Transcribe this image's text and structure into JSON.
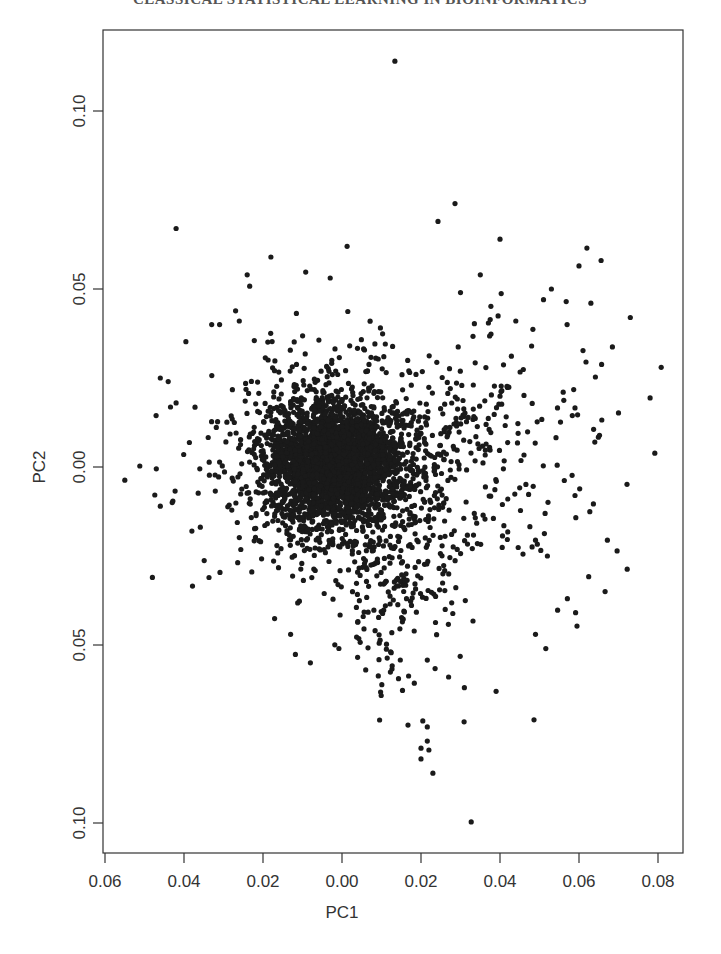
{
  "page": {
    "running_header": "CLASSICAL STATISTICAL LEARNING IN BIOINFORMATICS"
  },
  "chart_data": {
    "type": "scatter",
    "title": "",
    "xlabel": "PC1",
    "ylabel": "PC2",
    "xlim": [
      -0.061,
      0.087
    ],
    "ylim": [
      -0.108,
      0.123
    ],
    "x_ticks": [
      -0.06,
      -0.04,
      -0.02,
      0.0,
      0.02,
      0.04,
      0.06,
      0.08
    ],
    "x_tick_labels": [
      "0.06",
      "0.04",
      "0.02",
      "0.00",
      "0.02",
      "0.04",
      "0.06",
      "0.08"
    ],
    "y_ticks": [
      0.1,
      0.05,
      0.0,
      -0.05,
      -0.1
    ],
    "y_tick_labels": [
      "0.10",
      "0.05",
      "0.00",
      "0.05",
      "0.10"
    ],
    "grid": false,
    "legend": null,
    "point_color": "#1a1a1a",
    "point_radius": 2.6,
    "dense_cluster": {
      "center": [
        -0.002,
        0.001
      ],
      "sd": [
        0.0085,
        0.0085
      ],
      "n": 2600,
      "seed": 7
    },
    "halo": {
      "center": [
        0.002,
        0.0
      ],
      "sd": [
        0.017,
        0.016
      ],
      "n": 900,
      "seed": 13
    },
    "tail_down": {
      "center": [
        0.012,
        -0.035
      ],
      "sd": [
        0.008,
        0.014
      ],
      "n": 160,
      "seed": 29
    },
    "tail_right": {
      "center": [
        0.04,
        0.005
      ],
      "sd": [
        0.015,
        0.018
      ],
      "n": 170,
      "seed": 41
    },
    "outliers": [
      [
        0.0134,
        0.114
      ],
      [
        -0.042,
        0.067
      ],
      [
        0.0286,
        0.074
      ],
      [
        0.0243,
        0.069
      ],
      [
        0.04,
        0.064
      ],
      [
        0.0013,
        0.062
      ],
      [
        0.062,
        0.0615
      ],
      [
        0.0656,
        0.058
      ],
      [
        0.06,
        0.0565
      ],
      [
        -0.018,
        0.059
      ],
      [
        -0.024,
        0.054
      ],
      [
        0.0808,
        0.028
      ],
      [
        0.078,
        0.0194
      ],
      [
        0.07,
        0.0152
      ],
      [
        0.073,
        0.042
      ],
      [
        -0.055,
        -0.0037
      ],
      [
        -0.048,
        -0.031
      ],
      [
        0.0327,
        -0.0997
      ],
      [
        0.023,
        -0.086
      ],
      [
        0.02,
        -0.082
      ],
      [
        0.02,
        -0.079
      ],
      [
        0.022,
        -0.0795
      ],
      [
        0.0216,
        -0.077
      ],
      [
        0.0167,
        -0.0725
      ],
      [
        0.0216,
        -0.073
      ],
      [
        0.0486,
        -0.071
      ],
      [
        0.0722,
        -0.0287
      ],
      [
        0.0666,
        -0.035
      ],
      [
        0.0595,
        -0.0447
      ],
      [
        0.0516,
        -0.051
      ],
      [
        -0.046,
        0.025
      ],
      [
        -0.044,
        0.024
      ],
      [
        -0.047,
        -0.0005
      ],
      [
        -0.046,
        -0.011
      ],
      [
        -0.043,
        -0.01
      ],
      [
        -0.038,
        -0.018
      ],
      [
        -0.033,
        0.04
      ],
      [
        -0.031,
        0.04
      ],
      [
        -0.026,
        0.041
      ],
      [
        -0.036,
        -0.0005
      ],
      [
        -0.042,
        0.018
      ],
      [
        0.03,
        0.049
      ],
      [
        0.035,
        0.054
      ],
      [
        0.044,
        0.041
      ],
      [
        0.051,
        0.047
      ],
      [
        0.053,
        0.05
      ],
      [
        0.057,
        0.04
      ],
      [
        0.063,
        0.046
      ],
      [
        0.056,
        0.021
      ],
      [
        0.048,
        0.034
      ],
      [
        0.064,
        0.007
      ],
      [
        0.059,
        -0.008
      ],
      [
        0.052,
        -0.025
      ],
      [
        0.039,
        -0.063
      ],
      [
        0.031,
        -0.062
      ],
      [
        0.027,
        -0.059
      ],
      [
        -0.008,
        -0.055
      ],
      [
        -0.013,
        -0.047
      ],
      [
        0.006,
        -0.057
      ],
      [
        0.049,
        -0.047
      ]
    ]
  }
}
